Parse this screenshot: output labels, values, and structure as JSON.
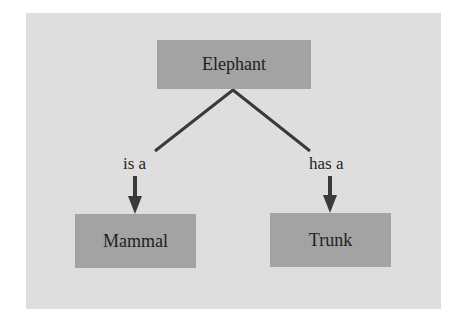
{
  "diagram": {
    "type": "semantic-network",
    "nodes": [
      {
        "id": "elephant",
        "label": "Elephant"
      },
      {
        "id": "mammal",
        "label": "Mammal"
      },
      {
        "id": "trunk",
        "label": "Trunk"
      }
    ],
    "edges": [
      {
        "from": "elephant",
        "to": "mammal",
        "label": "is a"
      },
      {
        "from": "elephant",
        "to": "trunk",
        "label": "has a"
      }
    ]
  },
  "colors": {
    "background": "#ffffff",
    "panel": "#dedede",
    "node_fill": "#a3a3a3",
    "line": "#3a3a3a",
    "text": "#1e1e1e"
  }
}
